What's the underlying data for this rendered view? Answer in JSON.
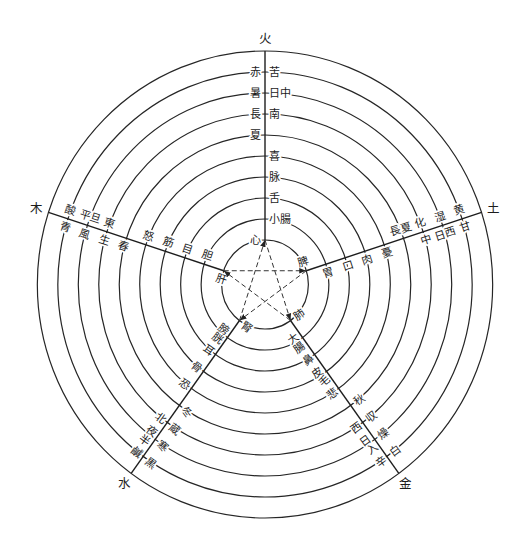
{
  "elements": [
    {
      "element": "火",
      "zang": "心",
      "fu": "小腸",
      "sense_organ": "舌",
      "tissue": "脉",
      "emotion": "喜",
      "season": "夏",
      "phase": "長",
      "direction": "南",
      "climate": "暑",
      "time": "日中",
      "color": "赤",
      "taste": "苦"
    },
    {
      "element": "土",
      "zang": "脾",
      "fu": "胃",
      "sense_organ": "口",
      "tissue": "肉",
      "emotion": "憂",
      "season": "長夏",
      "phase": "化",
      "direction": "中",
      "climate": "湿",
      "time": "日西",
      "color": "黄",
      "taste": "甘"
    },
    {
      "element": "金",
      "zang": "肺",
      "fu": "大腸",
      "sense_organ": "鼻",
      "tissue": "皮毛",
      "emotion": "悲",
      "season": "秋",
      "phase": "収",
      "direction": "西",
      "climate": "燥",
      "time": "日入",
      "color": "白",
      "taste": "辛"
    },
    {
      "element": "水",
      "zang": "腎",
      "fu": "膀胱",
      "sense_organ": "耳",
      "tissue": "骨",
      "emotion": "恐",
      "season": "冬",
      "phase": "蔵",
      "direction": "北",
      "climate": "寒",
      "time": "夜半",
      "color": "黒",
      "taste": "鹹"
    },
    {
      "element": "木",
      "zang": "肝",
      "fu": "胆",
      "sense_organ": "目",
      "tissue": "筋",
      "emotion": "怒",
      "season": "春",
      "phase": "生",
      "direction": "東",
      "climate": "風",
      "time": "平旦",
      "color": "青",
      "taste": "酸"
    }
  ],
  "cycles": {
    "controlling": [
      [
        "肝",
        "脾"
      ],
      [
        "脾",
        "腎"
      ],
      [
        "腎",
        "心"
      ],
      [
        "心",
        "肺"
      ],
      [
        "肺",
        "肝"
      ]
    ]
  }
}
